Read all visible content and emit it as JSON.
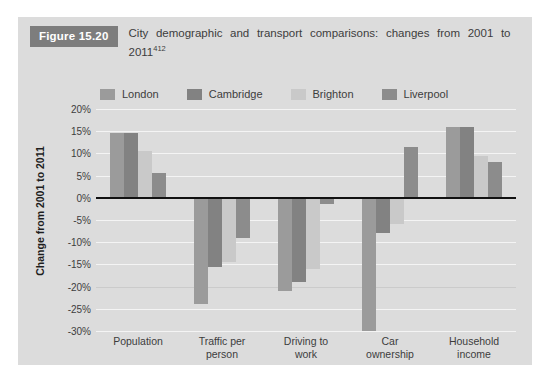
{
  "figure": {
    "badge": "Figure 15.20",
    "caption": "City demographic and transport comparisons: changes from 2001 to 2011",
    "caption_superscript": "412"
  },
  "chart_data": {
    "type": "bar",
    "title": "City demographic and transport comparisons: changes from 2001 to 2011",
    "xlabel": "",
    "ylabel": "Change from 2001 to 2011",
    "ylim": [
      -30,
      20
    ],
    "ytick_step": 5,
    "ytick_labels": [
      "20%",
      "15%",
      "10%",
      "5%",
      "0%",
      "-5%",
      "-10%",
      "-15%",
      "-20%",
      "-25%",
      "-30%"
    ],
    "ytick_values": [
      20,
      15,
      10,
      5,
      0,
      -5,
      -10,
      -15,
      -20,
      -25,
      -30
    ],
    "grid": true,
    "legend_position": "top",
    "categories": [
      "Population",
      "Traffic per person",
      "Driving to work",
      "Car ownership",
      "Household income"
    ],
    "category_lines": [
      [
        "Population"
      ],
      [
        "Traffic per",
        "person"
      ],
      [
        "Driving to",
        "work"
      ],
      [
        "Car",
        "ownership"
      ],
      [
        "Household",
        "income"
      ]
    ],
    "series": [
      {
        "name": "London",
        "color": "#9b9b9b",
        "values": [
          14.5,
          -24.0,
          -21.0,
          -30.0,
          16.0
        ]
      },
      {
        "name": "Cambridge",
        "color": "#828282",
        "values": [
          14.5,
          -15.5,
          -19.0,
          -8.0,
          16.0
        ]
      },
      {
        "name": "Brighton",
        "color": "#c9c9c9",
        "values": [
          10.5,
          -14.5,
          -16.0,
          -6.0,
          9.5
        ]
      },
      {
        "name": "Liverpool",
        "color": "#8c8c8c",
        "values": [
          5.5,
          -9.0,
          -1.5,
          11.5,
          8.0
        ]
      }
    ]
  }
}
